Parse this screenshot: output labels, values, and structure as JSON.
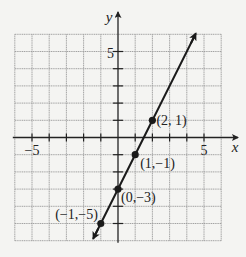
{
  "chart_data": {
    "type": "line",
    "title": "",
    "xlabel": "x",
    "ylabel": "y",
    "xlim": [
      -6,
      6
    ],
    "ylim": [
      -6,
      6
    ],
    "grid": true,
    "x_tick_labels": [
      {
        "value": -5,
        "label": "−5"
      },
      {
        "value": 5,
        "label": "5"
      }
    ],
    "y_tick_labels": [
      {
        "value": 5,
        "label": "5"
      }
    ],
    "equation": "y = 2x − 3",
    "series": [
      {
        "name": "line",
        "points": [
          {
            "x": -1,
            "y": -5,
            "label": "(−1,−5)"
          },
          {
            "x": 0,
            "y": -3,
            "label": "(0,−3)"
          },
          {
            "x": 1,
            "y": -1,
            "label": "(1,−1)"
          },
          {
            "x": 2,
            "y": 1,
            "label": "(2, 1)"
          }
        ],
        "extends_both_directions": true
      }
    ]
  },
  "colors": {
    "background": "#f4f4f2",
    "grid": "#9a9a9a",
    "axis": "#222222",
    "line": "#1a1a1a"
  }
}
